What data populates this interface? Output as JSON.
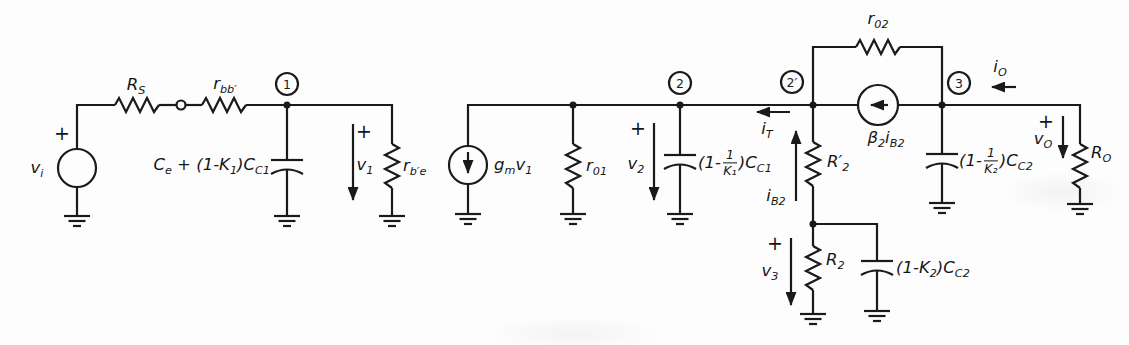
{
  "figure": {
    "ink_color": "#1a1a1a",
    "paper_color": "#fdfdfd"
  },
  "nodes": {
    "n1": "1",
    "n2": "2",
    "n2prime": "2′",
    "n3": "3"
  },
  "symbols": {
    "plus": "+"
  },
  "labels": {
    "vi": [
      {
        "t": "v"
      },
      {
        "s": "i"
      }
    ],
    "rs": [
      {
        "t": "R"
      },
      {
        "s": "S"
      }
    ],
    "rbb": [
      {
        "t": "r"
      },
      {
        "s": "bb′"
      }
    ],
    "ce_cc1": [
      {
        "t": "C"
      },
      {
        "s": "e"
      },
      {
        "t": " + (1-K"
      },
      {
        "s": "1"
      },
      {
        "t": ")C"
      },
      {
        "s": "C1"
      }
    ],
    "v1": [
      {
        "t": "v"
      },
      {
        "s": "1"
      }
    ],
    "rbe": [
      {
        "t": "r"
      },
      {
        "s": "b′e"
      }
    ],
    "gmv1": [
      {
        "t": "g"
      },
      {
        "s": "m"
      },
      {
        "t": "v"
      },
      {
        "s": "1"
      }
    ],
    "r01": [
      {
        "t": "r"
      },
      {
        "s": "01"
      }
    ],
    "v2": [
      {
        "t": "v"
      },
      {
        "s": "2"
      }
    ],
    "k1cc1": [
      {
        "t": "(1-"
      },
      {
        "f": [
          "1",
          "K₁"
        ]
      },
      {
        "t": ")C"
      },
      {
        "s": "C1"
      }
    ],
    "it": [
      {
        "t": "i"
      },
      {
        "s": "T"
      }
    ],
    "ib2": [
      {
        "t": "i"
      },
      {
        "s": "B2"
      }
    ],
    "r2prime": [
      {
        "t": "R′"
      },
      {
        "s": "2"
      }
    ],
    "r02": [
      {
        "t": "r"
      },
      {
        "s": "02"
      }
    ],
    "beta2ib2": [
      {
        "t": "β"
      },
      {
        "s": "2"
      },
      {
        "t": "i"
      },
      {
        "s": "B2"
      }
    ],
    "io": [
      {
        "t": "i"
      },
      {
        "s": "O"
      }
    ],
    "k2cc2_node3": [
      {
        "t": "(1-"
      },
      {
        "f": [
          "1",
          "K₂"
        ]
      },
      {
        "t": ")C"
      },
      {
        "s": "C2"
      }
    ],
    "vo": [
      {
        "t": "v"
      },
      {
        "s": "O"
      }
    ],
    "ro": [
      {
        "t": "R"
      },
      {
        "s": "O"
      }
    ],
    "v3": [
      {
        "t": "v"
      },
      {
        "s": "3"
      }
    ],
    "r2": [
      {
        "t": "R"
      },
      {
        "s": "2"
      }
    ],
    "k2cc2_r2": [
      {
        "t": "(1-K"
      },
      {
        "s": "2"
      },
      {
        "t": ")C"
      },
      {
        "s": "C2"
      }
    ]
  }
}
